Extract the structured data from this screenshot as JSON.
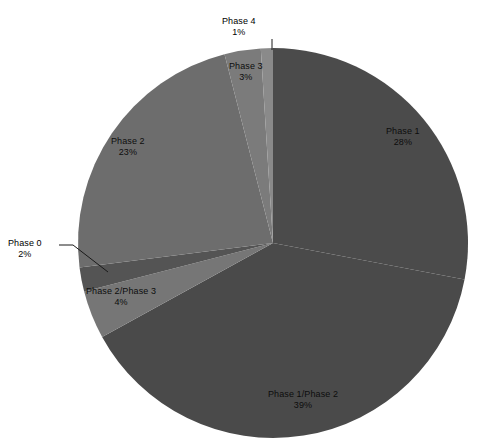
{
  "chart_data": {
    "type": "pie",
    "title": "",
    "subtitle": "",
    "xlabel": "",
    "ylabel": "",
    "legend_position": "none",
    "grid": false,
    "start_angle_deg": 0,
    "direction": "clockwise",
    "units": "percent",
    "total": 100,
    "categories": [
      "Phase 1",
      "Phase 1/Phase 2",
      "Phase 2/Phase 3",
      "Phase 0",
      "Phase 2",
      "Phase 3",
      "Phase 4"
    ],
    "values": [
      28,
      39,
      4,
      2,
      23,
      3,
      1
    ],
    "slices": [
      {
        "label": "Phase 1",
        "value": 28,
        "pct_text": "28%",
        "color": "#4b4b4b",
        "label_placement": "inside",
        "label_x": 386,
        "label_y": 126,
        "leader": false
      },
      {
        "label": "Phase 1/Phase 2",
        "value": 39,
        "pct_text": "39%",
        "color": "#4a4a4a",
        "label_placement": "inside",
        "label_x": 268,
        "label_y": 389,
        "leader": false
      },
      {
        "label": "Phase 2/Phase 3",
        "value": 4,
        "pct_text": "4%",
        "color": "#767676",
        "label_placement": "inside",
        "label_x": 86,
        "label_y": 286,
        "leader": false
      },
      {
        "label": "Phase 0",
        "value": 2,
        "pct_text": "2%",
        "color": "#545454",
        "label_placement": "outside",
        "label_x": 8,
        "label_y": 238,
        "leader": true,
        "leader_points": "59,245 73,245 108,272"
      },
      {
        "label": "Phase 2",
        "value": 23,
        "pct_text": "23%",
        "color": "#6d6d6d",
        "label_placement": "inside",
        "label_x": 111,
        "label_y": 136,
        "leader": false
      },
      {
        "label": "Phase 3",
        "value": 3,
        "pct_text": "3%",
        "color": "#7b7b7b",
        "label_placement": "inside",
        "label_x": 229,
        "label_y": 61,
        "leader": false
      },
      {
        "label": "Phase 4",
        "value": 1,
        "pct_text": "1%",
        "color": "#8a8a8a",
        "label_placement": "outside",
        "label_x": 222,
        "label_y": 16,
        "leader": true,
        "leader_points": "272,39 272,50"
      }
    ],
    "geometry": {
      "center_x": 273,
      "center_y": 243,
      "radius": 195
    },
    "background_color": "#ffffff"
  }
}
